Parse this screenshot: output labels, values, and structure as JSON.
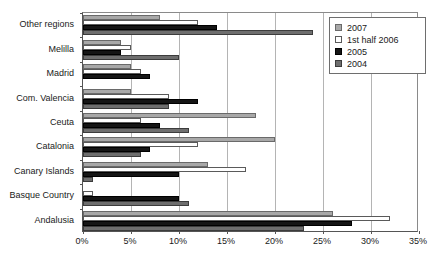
{
  "chart_data": {
    "type": "bar",
    "orientation": "horizontal",
    "title": "",
    "subtitle": "",
    "xlabel": "",
    "ylabel": "",
    "xlim": [
      0,
      35
    ],
    "xtick_labels": [
      "0%",
      "5%",
      "10%",
      "15%",
      "20%",
      "25%",
      "30%",
      "35%"
    ],
    "xtick_values": [
      0,
      5,
      10,
      15,
      20,
      25,
      30,
      35
    ],
    "grid": true,
    "legend_position": "top-right",
    "categories": [
      "Other regions",
      "Melilla",
      "Madrid",
      "Com. Valencia",
      "Ceuta",
      "Catalonia",
      "Canary Islands",
      "Basque Country",
      "Andalusia"
    ],
    "series": [
      {
        "name": "2007",
        "color": "#a8a8a8",
        "values": [
          8,
          4,
          5,
          5,
          18,
          20,
          13,
          0,
          26
        ]
      },
      {
        "name": "1st half 2006",
        "color": "#ffffff",
        "values": [
          12,
          5,
          6,
          9,
          6,
          12,
          17,
          1,
          32
        ]
      },
      {
        "name": "2005",
        "color": "#151515",
        "values": [
          14,
          4,
          7,
          12,
          8,
          7,
          10,
          10,
          28
        ]
      },
      {
        "name": "2004",
        "color": "#6e6e6e",
        "values": [
          24,
          10,
          0,
          9,
          11,
          6,
          1,
          11,
          23
        ]
      }
    ]
  },
  "legend": {
    "entries": [
      {
        "label": "2007",
        "swatch_class": "s2007"
      },
      {
        "label": "1st half 2006",
        "swatch_class": "s2006"
      },
      {
        "label": "2005",
        "swatch_class": "s2005"
      },
      {
        "label": "2004",
        "swatch_class": "s2004"
      }
    ]
  },
  "colors": {
    "series_2007": "#a8a8a8",
    "series_1st_half_2006": "#ffffff",
    "series_2005": "#151515",
    "series_2004": "#6e6e6e",
    "gridline": "#b4b4b4",
    "axis": "#555555",
    "text": "#1a1a1a",
    "background": "#ffffff"
  }
}
